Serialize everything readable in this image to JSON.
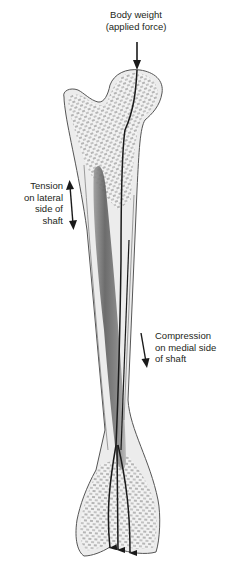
{
  "diagram": {
    "labels": {
      "body_weight": [
        "Body weight",
        "(applied force)"
      ],
      "tension": [
        "Tension",
        "on lateral",
        "side of",
        "shaft"
      ],
      "compression": [
        "Compression",
        "on medial side",
        "of shaft"
      ]
    },
    "arrows": [
      {
        "name": "applied-force-arrow",
        "direction": "down"
      },
      {
        "name": "tension-arrow",
        "direction": "bidirectional-vertical"
      },
      {
        "name": "compression-arrow",
        "direction": "down"
      },
      {
        "name": "load-path-arrows",
        "count": 3,
        "direction": "down"
      }
    ],
    "colors": {
      "bone_outline": "#555555",
      "bone_fill": "#ececec",
      "marrow": "#6e6e6e",
      "trabecular": "#7a7a7a",
      "arrow": "#1a1a1a",
      "text": "#231f20"
    }
  }
}
